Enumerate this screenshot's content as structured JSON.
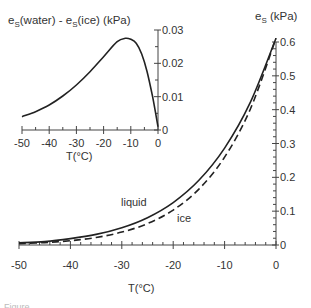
{
  "chart_data": [
    {
      "id": "inset",
      "type": "line",
      "title": "e_s(water) - e_s(ice)   (kPa)",
      "xlabel": "T(°C)",
      "ylabel": "(kPa)",
      "xlim": [
        -50,
        0
      ],
      "ylim": [
        0,
        0.03
      ],
      "x_ticks": [
        "-50",
        "-40",
        "-30",
        "-20",
        "-10",
        "0"
      ],
      "y_ticks": [
        "0",
        "0.01",
        "0.02",
        "0.03"
      ],
      "y_axis_position": "right",
      "grid": false,
      "series": [
        {
          "name": "e_s(water) - e_s(ice)",
          "style": "solid",
          "x": [
            -50,
            -45,
            -40,
            -35,
            -30,
            -25,
            -20,
            -15,
            -12,
            -10,
            -8,
            -6,
            -4,
            -2,
            0
          ],
          "values": [
            0.004,
            0.0055,
            0.0075,
            0.0102,
            0.0135,
            0.0175,
            0.022,
            0.0265,
            0.0275,
            0.0272,
            0.026,
            0.0228,
            0.0175,
            0.01,
            0.001
          ]
        }
      ]
    },
    {
      "id": "main",
      "type": "line",
      "title": "",
      "xlabel": "T(°C)",
      "ylabel": "e_s (kPa)",
      "xlim": [
        -50,
        0
      ],
      "ylim": [
        0,
        0.6
      ],
      "x_ticks": [
        "-50",
        "-40",
        "-30",
        "-20",
        "-10",
        "0"
      ],
      "y_ticks": [
        "0",
        "0.1",
        "0.2",
        "0.3",
        "0.4",
        "0.5",
        "0.6"
      ],
      "y_axis_position": "right",
      "grid": false,
      "annotations": [
        "liquid",
        "ice"
      ],
      "series": [
        {
          "name": "liquid",
          "style": "solid",
          "x": [
            -50,
            -45,
            -40,
            -35,
            -30,
            -25,
            -20,
            -15,
            -10,
            -5,
            0
          ],
          "values": [
            0.0064,
            0.0101,
            0.0189,
            0.0314,
            0.051,
            0.0807,
            0.1254,
            0.1912,
            0.2863,
            0.4215,
            0.6112
          ]
        },
        {
          "name": "ice",
          "style": "dashed",
          "x": [
            -50,
            -45,
            -40,
            -35,
            -30,
            -25,
            -20,
            -15,
            -10,
            -5,
            0
          ],
          "values": [
            0.0039,
            0.0072,
            0.0128,
            0.0223,
            0.038,
            0.0632,
            0.1032,
            0.1652,
            0.2597,
            0.4015,
            0.6112
          ]
        }
      ]
    }
  ],
  "inset": {
    "title_main": "e",
    "title_sub1": "S",
    "title_mid": "(water) - e",
    "title_sub2": "S",
    "title_end": "(ice)   (kPa)",
    "x_ticks": [
      "-50",
      "-40",
      "-30",
      "-20",
      "-10",
      "0"
    ],
    "y_ticks": [
      "0",
      "0.01",
      "0.02",
      "0.03"
    ],
    "xlabel": "T(°C)"
  },
  "main": {
    "ylabel_main": "e",
    "ylabel_sub": "S",
    "ylabel_unit": " (kPa)",
    "x_ticks": [
      "-50",
      "-40",
      "-30",
      "-20",
      "-10",
      "0"
    ],
    "y_ticks": [
      "0",
      "0.1",
      "0.2",
      "0.3",
      "0.4",
      "0.5",
      "0.6"
    ],
    "xlabel": "T(°C)",
    "label_liquid": "liquid",
    "label_ice": "ice"
  },
  "caption_fragment": "Figure"
}
